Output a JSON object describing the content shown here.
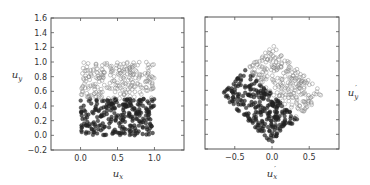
{
  "chart_data": [
    {
      "type": "scatter",
      "title": "",
      "xlabel": "u_x",
      "ylabel": "u_y",
      "xlim": [
        -0.4,
        1.4
      ],
      "ylim": [
        -0.2,
        1.6
      ],
      "xticks": [
        "0.0",
        "0.5",
        "1.0"
      ],
      "xtick_values": [
        0.0,
        0.5,
        1.0
      ],
      "yticks": [
        "1.6",
        "1.4",
        "1.2",
        "1.0",
        "0.8",
        "0.6",
        "0.4",
        "0.2",
        "0.0",
        "−0.2"
      ],
      "ytick_values": [
        1.6,
        1.4,
        1.2,
        1.0,
        0.8,
        0.6,
        0.4,
        0.2,
        0.0,
        -0.2
      ],
      "grid": false,
      "series": [
        {
          "name": "open markers (u_y > 0.5)",
          "marker": "open-circle",
          "region": "uniform square x∈[0,1], y∈[0.5,1]",
          "count": 250
        },
        {
          "name": "filled markers (u_y ≤ 0.5)",
          "marker": "filled-circle",
          "region": "uniform square x∈[0,1], y∈[0,0.5]",
          "count": 250
        }
      ]
    },
    {
      "type": "scatter",
      "title": "",
      "xlabel": "u_x'",
      "ylabel": "u_y'",
      "ylabel_position": "right",
      "xlim": [
        -0.9,
        0.9
      ],
      "ylim": [
        -0.2,
        1.6
      ],
      "xticks": [
        "−0.5",
        "0.0",
        "0.5"
      ],
      "xtick_values": [
        -0.5,
        0.0,
        0.5
      ],
      "yticks_labels_visible": false,
      "grid": false,
      "series": [
        {
          "name": "open markers (rotated upper half)",
          "marker": "open-circle",
          "region": "unit square rotated 45°",
          "count": 250
        },
        {
          "name": "filled markers (rotated lower half)",
          "marker": "filled-circle",
          "region": "unit square rotated 45°",
          "count": 250
        }
      ]
    }
  ],
  "labels": {
    "left_xlabel_main": "u",
    "left_xlabel_sub": "x",
    "left_ylabel_main": "u",
    "left_ylabel_sub": "y",
    "right_xlabel_main": "u",
    "right_xlabel_sub": "x",
    "right_xlabel_prime": "′",
    "right_ylabel_main": "u",
    "right_ylabel_sub": "y",
    "right_ylabel_prime": "′"
  },
  "style": {
    "open_marker_color": "#888888",
    "filled_marker_color": "#222222",
    "axis_color": "#555555"
  }
}
